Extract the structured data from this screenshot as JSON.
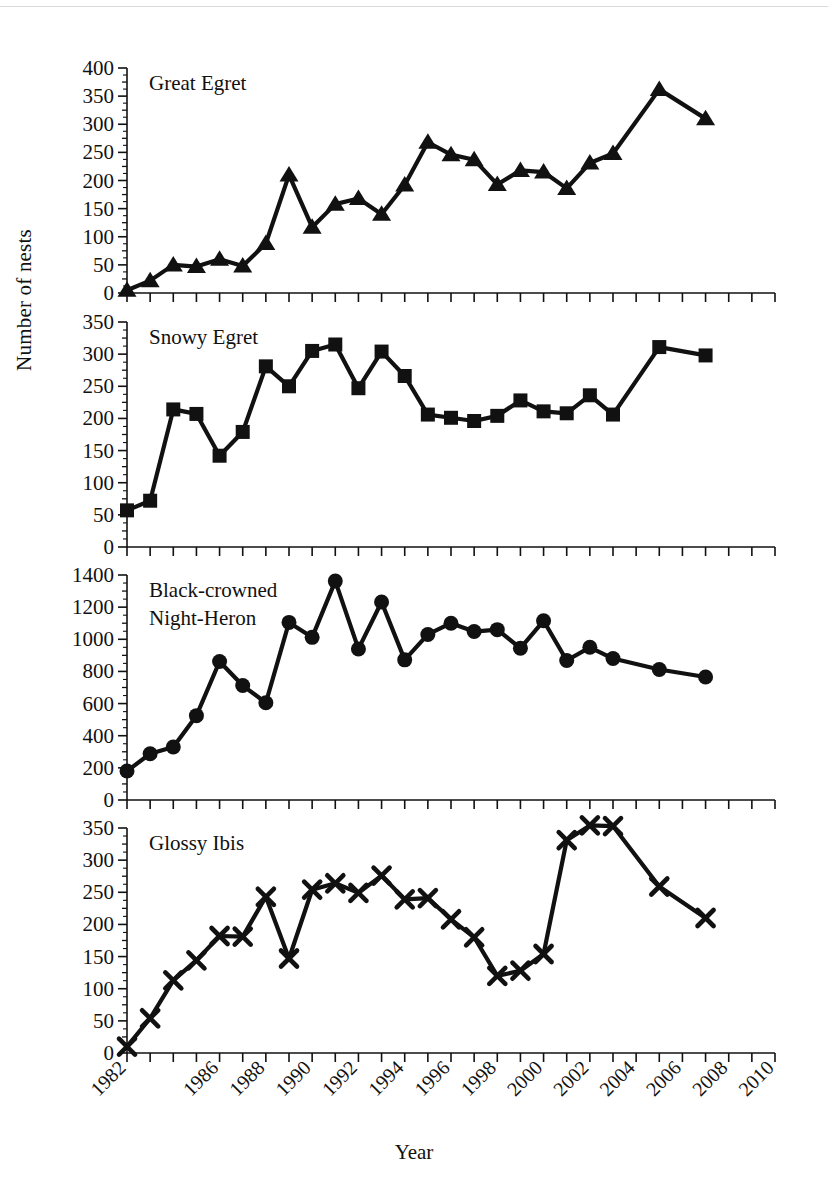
{
  "figure": {
    "ylabel": "Number of nests",
    "xlabel": "Year"
  },
  "chart_data": {
    "type": "line",
    "title": "",
    "xlabel": "Year",
    "ylabel": "Number of nests",
    "xlim": [
      1982,
      2010
    ],
    "grid": false,
    "legend": "none (panel titles)",
    "x_tick_labels": [
      "1982",
      "1986",
      "1988",
      "1990",
      "1992",
      "1994",
      "1996",
      "1998",
      "2000",
      "2002",
      "2004",
      "2006",
      "2008",
      "2010"
    ],
    "x_tick_values": [
      1982,
      1986,
      1988,
      1990,
      1992,
      1994,
      1996,
      1998,
      2000,
      2002,
      2004,
      2006,
      2008,
      2010
    ],
    "x_minor_tick_interval": 1,
    "panels": [
      {
        "name": "great-egret",
        "title": "Great Egret",
        "marker": "triangle",
        "ylim": [
          0,
          400
        ],
        "y_tick_labels": [
          "0",
          "50",
          "100",
          "150",
          "200",
          "250",
          "300",
          "350",
          "400"
        ],
        "y_tick_values": [
          0,
          50,
          100,
          150,
          200,
          250,
          300,
          350,
          400
        ],
        "x": [
          1982,
          1983,
          1984,
          1985,
          1986,
          1987,
          1988,
          1989,
          1990,
          1991,
          1992,
          1993,
          1994,
          1995,
          1996,
          1997,
          1998,
          1999,
          2000,
          2001,
          2002,
          2003,
          2004,
          2005,
          2007,
          2009
        ],
        "values": [
          5,
          22,
          50,
          47,
          60,
          48,
          88,
          210,
          117,
          158,
          168,
          140,
          192,
          268,
          246,
          237,
          193,
          218,
          215,
          186,
          231,
          248,
          362,
          310,
          null,
          null
        ],
        "series": [
          {
            "name": "Great Egret",
            "points": [
              [
                1982,
                5
              ],
              [
                1983,
                22
              ],
              [
                1984,
                50
              ],
              [
                1985,
                47
              ],
              [
                1986,
                60
              ],
              [
                1987,
                48
              ],
              [
                1988,
                88
              ],
              [
                1989,
                210
              ],
              [
                1990,
                117
              ],
              [
                1991,
                158
              ],
              [
                1992,
                168
              ],
              [
                1993,
                140
              ],
              [
                1994,
                192
              ],
              [
                1995,
                268
              ],
              [
                1996,
                246
              ],
              [
                1997,
                237
              ],
              [
                1998,
                193
              ],
              [
                1999,
                218
              ],
              [
                2000,
                215
              ],
              [
                2001,
                186
              ],
              [
                2002,
                231
              ],
              [
                2003,
                248
              ],
              [
                2005,
                362
              ],
              [
                2007,
                310
              ]
            ]
          }
        ]
      },
      {
        "name": "snowy-egret",
        "title": "Snowy Egret",
        "marker": "square",
        "ylim": [
          0,
          350
        ],
        "y_tick_labels": [
          "0",
          "50",
          "100",
          "150",
          "200",
          "250",
          "300",
          "350"
        ],
        "y_tick_values": [
          0,
          50,
          100,
          150,
          200,
          250,
          300,
          350
        ],
        "series": [
          {
            "name": "Snowy Egret",
            "points": [
              [
                1982,
                57
              ],
              [
                1983,
                72
              ],
              [
                1984,
                214
              ],
              [
                1985,
                207
              ],
              [
                1986,
                142
              ],
              [
                1987,
                179
              ],
              [
                1988,
                281
              ],
              [
                1989,
                250
              ],
              [
                1990,
                305
              ],
              [
                1991,
                315
              ],
              [
                1992,
                247
              ],
              [
                1993,
                304
              ],
              [
                1994,
                266
              ],
              [
                1995,
                206
              ],
              [
                1996,
                201
              ],
              [
                1997,
                196
              ],
              [
                1998,
                204
              ],
              [
                1999,
                228
              ],
              [
                2000,
                211
              ],
              [
                2001,
                208
              ],
              [
                2002,
                236
              ],
              [
                2003,
                206
              ],
              [
                2005,
                311
              ],
              [
                2007,
                298
              ]
            ]
          }
        ]
      },
      {
        "name": "black-crowned-night-heron",
        "title": "Black-crowned Night-Heron",
        "title_line1": "Black-crowned",
        "title_line2": "Night-Heron",
        "marker": "circle",
        "ylim": [
          0,
          1400
        ],
        "y_tick_labels": [
          "0",
          "200",
          "400",
          "600",
          "800",
          "1000",
          "1200",
          "1400"
        ],
        "y_tick_values": [
          0,
          200,
          400,
          600,
          800,
          1000,
          1200,
          1400
        ],
        "series": [
          {
            "name": "Black-crowned Night-Heron",
            "points": [
              [
                1982,
                180
              ],
              [
                1983,
                288
              ],
              [
                1984,
                330
              ],
              [
                1985,
                525
              ],
              [
                1986,
                862
              ],
              [
                1987,
                712
              ],
              [
                1988,
                605
              ],
              [
                1989,
                1105
              ],
              [
                1990,
                1012
              ],
              [
                1991,
                1362
              ],
              [
                1992,
                940
              ],
              [
                1993,
                1232
              ],
              [
                1994,
                872
              ],
              [
                1995,
                1030
              ],
              [
                1996,
                1100
              ],
              [
                1997,
                1048
              ],
              [
                1998,
                1060
              ],
              [
                1999,
                945
              ],
              [
                2000,
                1115
              ],
              [
                2001,
                868
              ],
              [
                2002,
                950
              ],
              [
                2003,
                880
              ],
              [
                2005,
                812
              ],
              [
                2007,
                765
              ]
            ]
          }
        ]
      },
      {
        "name": "glossy-ibis",
        "title": "Glossy Ibis",
        "marker": "cross",
        "ylim": [
          0,
          350
        ],
        "y_tick_labels": [
          "0",
          "50",
          "100",
          "150",
          "200",
          "250",
          "300",
          "350"
        ],
        "y_tick_values": [
          0,
          50,
          100,
          150,
          200,
          250,
          300,
          350
        ],
        "series": [
          {
            "name": "Glossy Ibis",
            "points": [
              [
                1982,
                10
              ],
              [
                1983,
                54
              ],
              [
                1984,
                113
              ],
              [
                1985,
                144
              ],
              [
                1986,
                182
              ],
              [
                1987,
                181
              ],
              [
                1988,
                243
              ],
              [
                1989,
                147
              ],
              [
                1990,
                254
              ],
              [
                1991,
                264
              ],
              [
                1992,
                249
              ],
              [
                1993,
                276
              ],
              [
                1994,
                239
              ],
              [
                1995,
                241
              ],
              [
                1996,
                208
              ],
              [
                1997,
                180
              ],
              [
                1998,
                120
              ],
              [
                1999,
                128
              ],
              [
                2000,
                154
              ],
              [
                2001,
                331
              ],
              [
                2002,
                354
              ],
              [
                2003,
                353
              ],
              [
                2005,
                259
              ],
              [
                2007,
                210
              ]
            ]
          }
        ]
      }
    ]
  }
}
